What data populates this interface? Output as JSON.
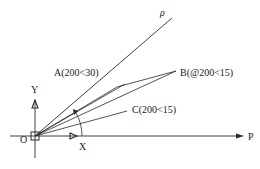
{
  "diagram": {
    "type": "polar-coordinate-construction",
    "colors": {
      "line": "#2a2a2a",
      "background": "#ffffff"
    },
    "origin_label": "O",
    "axes": {
      "x_label": "X",
      "y_label": "Y",
      "p_label": "P",
      "rho_label": "ρ"
    },
    "points": {
      "a": {
        "label": "A(200<30)"
      },
      "b": {
        "label": "B(@200<15)"
      },
      "c": {
        "label": "C(200<15)"
      }
    }
  }
}
